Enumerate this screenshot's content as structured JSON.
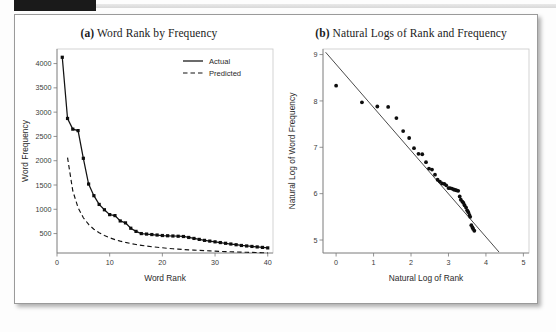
{
  "figure": {
    "panel_a_title_label": "(a)",
    "panel_a_title_text": " Word Rank by Frequency",
    "panel_b_title_label": "(b)",
    "panel_b_title_text": " Natural Logs of Rank and Frequency",
    "frame_color": "#9a9a9a",
    "ink_color": "#121212"
  },
  "chart_data": [
    {
      "type": "line",
      "id": "panel-a",
      "title": "(a) Word Rank by Frequency",
      "xlabel": "Word Rank",
      "ylabel": "Word Frequency",
      "xlim": [
        0,
        41
      ],
      "ylim": [
        100,
        4300
      ],
      "xticks": [
        0,
        10,
        20,
        30,
        40
      ],
      "yticks": [
        500,
        1000,
        1500,
        2000,
        2500,
        3000,
        3500,
        4000
      ],
      "grid": false,
      "legend_position": "top-right",
      "x": [
        1,
        2,
        3,
        4,
        5,
        6,
        7,
        8,
        9,
        10,
        11,
        12,
        13,
        14,
        15,
        16,
        17,
        18,
        19,
        20,
        21,
        22,
        23,
        24,
        25,
        26,
        27,
        28,
        29,
        30,
        31,
        32,
        33,
        34,
        35,
        36,
        37,
        38,
        39,
        40
      ],
      "series": [
        {
          "name": "Actual",
          "style": "solid",
          "marker": "filled-square",
          "values": [
            4130,
            2870,
            2650,
            2620,
            2050,
            1520,
            1280,
            1100,
            990,
            890,
            870,
            760,
            720,
            610,
            545,
            500,
            490,
            480,
            470,
            460,
            455,
            450,
            445,
            440,
            420,
            400,
            380,
            360,
            345,
            330,
            315,
            300,
            285,
            270,
            255,
            245,
            235,
            225,
            215,
            205
          ]
        },
        {
          "name": "Predicted",
          "style": "dashed",
          "marker": "none",
          "values": [
            null,
            2065,
            1377,
            1033,
            826,
            688,
            590,
            516,
            459,
            413,
            376,
            344,
            318,
            295,
            275,
            258,
            243,
            229,
            218,
            207,
            197,
            188,
            180,
            172,
            165,
            159,
            153,
            148,
            143,
            138,
            133,
            129,
            125,
            121,
            118,
            115,
            112,
            109,
            106,
            103
          ]
        }
      ]
    },
    {
      "type": "scatter",
      "id": "panel-b",
      "title": "(b) Natural Logs of Rank and Frequency",
      "xlabel": "Natural Log of Rank",
      "ylabel": "Natural Log of Word Frequency",
      "xlim": [
        -0.35,
        5.15
      ],
      "ylim": [
        4.72,
        9.12
      ],
      "xticks": [
        0,
        1,
        2,
        3,
        4,
        5
      ],
      "yticks": [
        5,
        6,
        7,
        8,
        9
      ],
      "grid": false,
      "marker": "filled-circle",
      "points": [
        [
          0.0,
          8.33
        ],
        [
          0.69,
          7.97
        ],
        [
          1.1,
          7.88
        ],
        [
          1.39,
          7.87
        ],
        [
          1.61,
          7.63
        ],
        [
          1.79,
          7.35
        ],
        [
          1.95,
          7.2
        ],
        [
          2.08,
          6.98
        ],
        [
          2.2,
          6.86
        ],
        [
          2.3,
          6.85
        ],
        [
          2.4,
          6.68
        ],
        [
          2.48,
          6.54
        ],
        [
          2.56,
          6.52
        ],
        [
          2.64,
          6.41
        ],
        [
          2.71,
          6.3
        ],
        [
          2.77,
          6.26
        ],
        [
          2.83,
          6.22
        ],
        [
          2.89,
          6.21
        ],
        [
          2.94,
          6.18
        ],
        [
          3.0,
          6.12
        ],
        [
          3.04,
          6.12
        ],
        [
          3.09,
          6.11
        ],
        [
          3.14,
          6.09
        ],
        [
          3.18,
          6.08
        ],
        [
          3.22,
          6.07
        ],
        [
          3.26,
          6.06
        ],
        [
          3.3,
          5.94
        ],
        [
          3.33,
          5.87
        ],
        [
          3.37,
          5.83
        ],
        [
          3.4,
          5.8
        ],
        [
          3.43,
          5.75
        ],
        [
          3.47,
          5.7
        ],
        [
          3.5,
          5.64
        ],
        [
          3.53,
          5.6
        ],
        [
          3.56,
          5.54
        ],
        [
          3.58,
          5.5
        ],
        [
          3.61,
          5.32
        ],
        [
          3.64,
          5.27
        ],
        [
          3.66,
          5.24
        ],
        [
          3.69,
          5.2
        ]
      ],
      "fit_line": {
        "name": "regression-line",
        "from": [
          -0.28,
          9.05
        ],
        "to": [
          4.35,
          4.74
        ]
      }
    }
  ],
  "legend": {
    "items": [
      {
        "label": "Actual",
        "style": "solid"
      },
      {
        "label": "Predicted",
        "style": "dashed"
      }
    ]
  }
}
